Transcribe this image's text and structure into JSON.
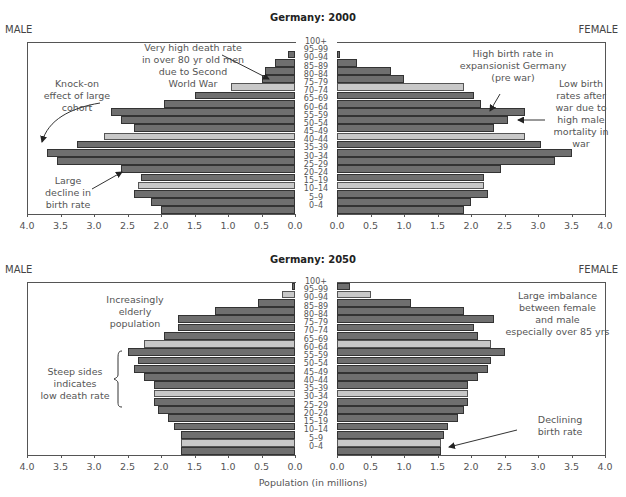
{
  "chart_data": [
    {
      "type": "bar",
      "orientation": "horizontal-population-pyramid",
      "title": "Germany: 2000",
      "left_label": "MALE",
      "right_label": "FEMALE",
      "xlabel": "",
      "xlim": [
        0,
        4.0
      ],
      "xticks_left": [
        "4.0",
        "3.5",
        "3.0",
        "2.5",
        "2.0",
        "1.5",
        "1.0",
        "0.5",
        "0.0"
      ],
      "xticks_right": [
        "0.0",
        "0.5",
        "1.0",
        "1.5",
        "2.0",
        "2.5",
        "3.0",
        "3.5",
        "4.0"
      ],
      "categories": [
        "100+",
        "95–99",
        "90–94",
        "85–89",
        "80–84",
        "75–79",
        "70–74",
        "65–69",
        "60–64",
        "55–59",
        "50–54",
        "45–49",
        "40–44",
        "35–39",
        "30–34",
        "25–29",
        "20–24",
        "15–19",
        "10–14",
        "5–9",
        "0–4"
      ],
      "highlighted": [
        "75–79",
        "45–49",
        "15–19"
      ],
      "series": [
        {
          "name": "Male",
          "values": [
            0.0,
            0.1,
            0.3,
            0.45,
            0.5,
            0.95,
            1.5,
            1.95,
            2.75,
            2.6,
            2.4,
            2.85,
            3.25,
            3.7,
            3.55,
            2.6,
            2.3,
            2.35,
            2.4,
            2.15,
            2.0
          ]
        },
        {
          "name": "Female",
          "values": [
            0.0,
            0.05,
            0.3,
            0.8,
            1.0,
            1.9,
            2.05,
            2.15,
            2.8,
            2.55,
            2.35,
            2.8,
            3.05,
            3.5,
            3.25,
            2.45,
            2.2,
            2.2,
            2.25,
            2.0,
            1.9
          ]
        }
      ],
      "annotations": [
        {
          "text": "Very high death rate in over 80 yr old men due to Second World War",
          "lines": [
            "Very high death rate",
            "in over 80 yr old men",
            "due to Second",
            "World War"
          ],
          "side": "male"
        },
        {
          "text": "Knock-on effect of large cohort",
          "lines": [
            "Knock-on",
            "effect of large",
            "cohort"
          ],
          "side": "male"
        },
        {
          "text": "Large decline in birth rate",
          "lines": [
            "Large",
            "decline in",
            "birth rate"
          ],
          "side": "male"
        },
        {
          "text": "High birth rate in expansionist Germany (pre war)",
          "lines": [
            "High birth rate in",
            "expansionist Germany",
            "(pre war)"
          ],
          "side": "female"
        },
        {
          "text": "Low birth rates after war due to high male mortality in war",
          "lines": [
            "Low birth",
            "rates after",
            "war due to",
            "high male",
            "mortality in",
            "war"
          ],
          "side": "female"
        }
      ]
    },
    {
      "type": "bar",
      "orientation": "horizontal-population-pyramid",
      "title": "Germany: 2050",
      "left_label": "MALE",
      "right_label": "FEMALE",
      "xlabel": "Population (in millions)",
      "xlim": [
        0,
        4.0
      ],
      "xticks_left": [
        "4.0",
        "3.5",
        "3.0",
        "2.5",
        "2.0",
        "1.5",
        "1.0",
        "0.5",
        "0.0"
      ],
      "xticks_right": [
        "0.0",
        "0.5",
        "1.0",
        "1.5",
        "2.0",
        "2.5",
        "3.0",
        "3.5",
        "4.0"
      ],
      "categories": [
        "100+",
        "95–99",
        "90–94",
        "85–89",
        "80–84",
        "75–79",
        "70–74",
        "65–69",
        "60–64",
        "55–59",
        "50–54",
        "45–49",
        "40–44",
        "35–39",
        "30–34",
        "25–29",
        "20–24",
        "15–19",
        "10–14",
        "5–9",
        "0–4"
      ],
      "highlighted": [
        "95–99",
        "65–69",
        "35–39",
        "5–9"
      ],
      "series": [
        {
          "name": "Male",
          "values": [
            0.05,
            0.2,
            0.55,
            1.2,
            1.75,
            1.75,
            1.95,
            2.25,
            2.5,
            2.35,
            2.4,
            2.25,
            2.1,
            2.1,
            2.1,
            2.05,
            1.9,
            1.8,
            1.7,
            1.7,
            1.7
          ]
        },
        {
          "name": "Female",
          "values": [
            0.2,
            0.5,
            1.1,
            1.9,
            2.35,
            2.05,
            2.1,
            2.3,
            2.5,
            2.3,
            2.25,
            2.1,
            1.95,
            1.95,
            1.95,
            1.9,
            1.8,
            1.65,
            1.6,
            1.55,
            1.55
          ]
        }
      ],
      "annotations": [
        {
          "text": "Increasingly elderly population",
          "lines": [
            "Increasingly",
            "elderly",
            "population"
          ],
          "side": "male"
        },
        {
          "text": "Steep sides indicates low death rate",
          "lines": [
            "Steep sides",
            "indicates",
            "low death rate"
          ],
          "side": "male"
        },
        {
          "text": "Large imbalance between female and male especially over 85 yrs",
          "lines": [
            "Large imbalance",
            "between female",
            "and male",
            "especially over 85 yrs"
          ],
          "side": "female"
        },
        {
          "text": "Declining birth rate",
          "lines": [
            "Declining",
            "birth rate"
          ],
          "side": "female"
        }
      ]
    }
  ],
  "colors": {
    "bar": "#6f6f6f",
    "highlight_bar": "#c8c8c8",
    "border": "#333333"
  }
}
